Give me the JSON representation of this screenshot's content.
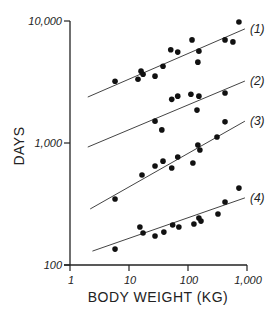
{
  "chart_data": {
    "type": "scatter",
    "title": "",
    "xlabel": "BODY WEIGHT (KG)",
    "ylabel": "DAYS",
    "xscale": "log",
    "yscale": "log",
    "xlim": [
      1,
      1000
    ],
    "ylim": [
      100,
      10000
    ],
    "x_ticks": [
      1,
      10,
      100,
      1000
    ],
    "x_tick_labels": [
      "1",
      "10",
      "100",
      "1,000"
    ],
    "y_ticks": [
      100,
      1000,
      10000
    ],
    "y_tick_labels": [
      "100",
      "1,000",
      "10,000"
    ],
    "grid": false,
    "legend": "inline labels at right end of each fit line",
    "series": [
      {
        "name": "(1)",
        "points": [
          [
            5.8,
            3210
          ],
          [
            14.2,
            3330
          ],
          [
            17.3,
            3660
          ],
          [
            16,
            3880
          ],
          [
            27.6,
            3530
          ],
          [
            37.7,
            4260
          ],
          [
            51,
            5810
          ],
          [
            67,
            5560
          ],
          [
            117,
            7000
          ],
          [
            153,
            5660
          ],
          [
            147,
            4600
          ],
          [
            424,
            7000
          ],
          [
            577,
            6740
          ],
          [
            730,
            9800
          ]
        ],
        "fit_line": [
          [
            2.0,
            2380
          ],
          [
            922,
            8620
          ]
        ]
      },
      {
        "name": "(2)",
        "points": [
          [
            27.6,
            1510
          ],
          [
            36,
            1280
          ],
          [
            53,
            2280
          ],
          [
            67,
            2420
          ],
          [
            112,
            2510
          ],
          [
            153,
            2420
          ],
          [
            142,
            1860
          ],
          [
            424,
            2570
          ]
        ],
        "fit_line": [
          [
            2.0,
            926
          ],
          [
            922,
            3220
          ]
        ]
      },
      {
        "name": "(3)",
        "points": [
          [
            5.8,
            348
          ],
          [
            16.6,
            547
          ],
          [
            27.6,
            647
          ],
          [
            37.7,
            710
          ],
          [
            53,
            624
          ],
          [
            67,
            768
          ],
          [
            121,
            685
          ],
          [
            147,
            962
          ],
          [
            159,
            876
          ],
          [
            310,
            1120
          ],
          [
            424,
            1490
          ]
        ],
        "fit_line": [
          [
            2.2,
            288
          ],
          [
            922,
            1510
          ]
        ]
      },
      {
        "name": "(4)",
        "points": [
          [
            5.8,
            135
          ],
          [
            15.3,
            205
          ],
          [
            17.3,
            183
          ],
          [
            27.6,
            173
          ],
          [
            39,
            186
          ],
          [
            55,
            213
          ],
          [
            70,
            205
          ],
          [
            126,
            217
          ],
          [
            153,
            243
          ],
          [
            166,
            229
          ],
          [
            322,
            262
          ],
          [
            424,
            328
          ],
          [
            730,
            427
          ]
        ],
        "fit_line": [
          [
            2.4,
            130
          ],
          [
            922,
            355
          ]
        ]
      }
    ]
  },
  "style": {
    "ink": "#222222",
    "line": "#444444",
    "background": "#ffffff"
  }
}
